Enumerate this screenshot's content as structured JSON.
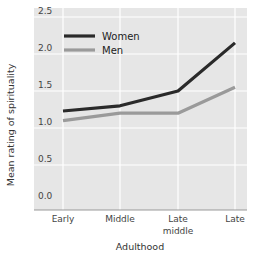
{
  "chart_data": {
    "type": "line",
    "title": "",
    "xlabel": "Adulthood",
    "ylabel": "Mean rating of spirituality",
    "categories": [
      "Early",
      "Middle",
      "Late middle",
      "Late"
    ],
    "category_lines": [
      [
        "Early"
      ],
      [
        "Middle"
      ],
      [
        "Late",
        "middle"
      ],
      [
        "Late"
      ]
    ],
    "yticks": [
      "0.0",
      "0.5",
      "1.0",
      "1.5",
      "2.0",
      "2.5"
    ],
    "ytick_values": [
      0,
      0.5,
      1.0,
      1.5,
      2.0,
      2.5
    ],
    "ylim": [
      0,
      2.6
    ],
    "grid": true,
    "legend_position": "upper left",
    "series": [
      {
        "name": "Women",
        "values": [
          1.23,
          1.3,
          1.5,
          2.15
        ],
        "color": "#2a2a2a"
      },
      {
        "name": "Men",
        "values": [
          1.1,
          1.2,
          1.2,
          1.55
        ],
        "color": "#9a9a9a"
      }
    ]
  },
  "colors": {
    "plot_background": "#e6e6e6",
    "gridline": "#ffffff",
    "axis_line": "#999999"
  }
}
